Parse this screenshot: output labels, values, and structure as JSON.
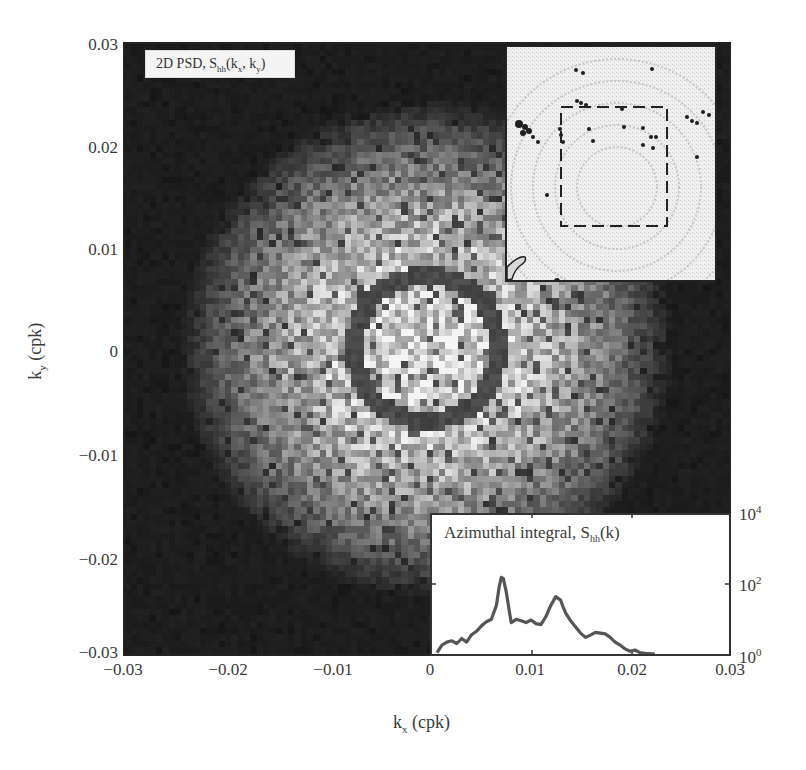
{
  "chart_data": [
    {
      "type": "heatmap",
      "title": "2D PSD, S_hh(k_x, k_y)",
      "title_parts": {
        "prefix": "2D PSD, S",
        "sub": "hh",
        "args_open": "(k",
        "arg1_sub": "x",
        "mid": ", k",
        "arg2_sub": "y",
        "close": ")"
      },
      "xlabel": "k_x (cpk)",
      "ylabel": "k_y (cpk)",
      "xlabel_parts": {
        "main": "k",
        "sub": "x",
        "unit": " (cpk)"
      },
      "ylabel_parts": {
        "main": "k",
        "sub": "y",
        "unit": " (cpk)"
      },
      "xlim": [
        -0.03,
        0.03
      ],
      "ylim": [
        -0.03,
        0.03
      ],
      "xticks": [
        "-0.03",
        "-0.02",
        "-0.01",
        "0",
        "0.01",
        "0.02",
        "0.03"
      ],
      "yticks": [
        "0.03",
        "0.02",
        "0.01",
        "0",
        "-0.01",
        "-0.02",
        "-0.03"
      ],
      "colormap": "grayscale (bright = high power)",
      "features": {
        "bright_disk_radius_cpk": 0.022,
        "ring_center_cpk": [
          0.0,
          0.0
        ],
        "ring_radius_cpk": 0.0072,
        "ring_appearance": "dark ring (annotation) around peak wavenumber",
        "secondary_ring_radius_cpk": 0.013,
        "dark_corners": true
      },
      "grid": false
    },
    {
      "type": "line",
      "title": "Azimuthal integral, S_hh(k)",
      "title_parts": {
        "prefix": "Azimuthal integral, S",
        "sub": "hh",
        "suffix": "(k)"
      },
      "xlim": [
        0,
        0.03
      ],
      "yscale": "log",
      "ylim": [
        1,
        10000
      ],
      "yticks": [
        {
          "base": "10",
          "exp": "0"
        },
        {
          "base": "10",
          "exp": "2"
        },
        {
          "base": "10",
          "exp": "4"
        }
      ],
      "xticks_shared": [
        "0",
        "0.01",
        "0.02",
        "0.03"
      ],
      "series": [
        {
          "name": "S_hh(k)",
          "color": "#555555",
          "x": [
            0.0005,
            0.001,
            0.0015,
            0.002,
            0.0025,
            0.003,
            0.0035,
            0.004,
            0.0045,
            0.005,
            0.0055,
            0.006,
            0.0065,
            0.0068,
            0.007,
            0.0072,
            0.0075,
            0.0078,
            0.008,
            0.0085,
            0.009,
            0.0095,
            0.01,
            0.0105,
            0.011,
            0.0115,
            0.012,
            0.0125,
            0.013,
            0.0132,
            0.0135,
            0.014,
            0.0145,
            0.015,
            0.0155,
            0.016,
            0.0165,
            0.017,
            0.0175,
            0.018,
            0.0185,
            0.019,
            0.0195,
            0.02,
            0.0205,
            0.021,
            0.0215,
            0.022,
            0.0225
          ],
          "values": [
            1.1,
            1.8,
            2.2,
            2.4,
            2.0,
            2.8,
            2.2,
            3.6,
            4.5,
            6.5,
            8.5,
            10,
            25,
            90,
            160,
            150,
            60,
            18,
            8,
            10,
            9,
            8,
            9.5,
            7.5,
            7,
            12,
            25,
            45,
            35,
            24,
            15,
            9,
            6,
            4,
            3,
            3.5,
            4.2,
            4,
            3.8,
            3.0,
            2.2,
            1.8,
            1.4,
            1.2,
            1.3,
            1.1,
            1.05,
            1.02,
            1.0
          ]
        }
      ],
      "annotations": [
        "Peak near k ≈ 0.007 cpk (~10^2)",
        "Secondary peak near k ≈ 0.013 cpk"
      ]
    },
    {
      "type": "image",
      "title": "Location map inset",
      "description": "Grayscale spatial map with concentric wave-like ripples; dashed square marks the analysis region",
      "dashed_box": true
    }
  ],
  "labels": {
    "yticks": [
      "0.03",
      "0.02",
      "0.01",
      "0",
      "−0.01",
      "−0.02",
      "−0.03"
    ],
    "xticks": [
      "−0.03",
      "−0.02",
      "−0.01",
      "0",
      "0.01",
      "0.02",
      "0.03"
    ],
    "rticks": [
      {
        "base": "10",
        "exp": "4"
      },
      {
        "base": "10",
        "exp": "2"
      },
      {
        "base": "10",
        "exp": "0"
      }
    ],
    "xlabel_main": "k",
    "xlabel_sub": "x",
    "xlabel_unit": " (cpk)",
    "ylabel_main": "k",
    "ylabel_sub": "y",
    "ylabel_unit": " (cpk)",
    "title_prefix": "2D PSD, S",
    "title_sub": "hh",
    "title_open": "(k",
    "title_x": "x",
    "title_mid": ", k",
    "title_y": "y",
    "title_close": ")",
    "spectrum_prefix": "Azimuthal integral, S",
    "spectrum_sub": "hh",
    "spectrum_suffix": "(k)"
  },
  "colors": {
    "frame": "#222222",
    "line": "#555555",
    "text": "#3a3a3a",
    "ring": "#3c3c3c"
  }
}
